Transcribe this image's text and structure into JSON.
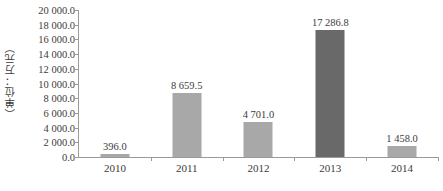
{
  "chart_data": {
    "type": "bar",
    "title": "",
    "subtitle": "",
    "xlabel": "",
    "ylabel": "（单位：万元）",
    "categories": [
      "2010",
      "2011",
      "2012",
      "2013",
      "2014"
    ],
    "values": [
      396.0,
      8659.5,
      4701.0,
      17286.8,
      1458.0
    ],
    "value_labels": [
      "396.0",
      "8 659.5",
      "4 701.0",
      "17 286.8",
      "1 458.0"
    ],
    "series": [
      {
        "name": "",
        "values": [
          396.0,
          8659.5,
          4701.0,
          17286.8,
          1458.0
        ]
      }
    ],
    "ylim": [
      0,
      20000
    ],
    "ytick_step": 2000,
    "ytick_labels": [
      "20 000.0",
      "18 000.0",
      "16 000.0",
      "14 000.0",
      "12 000.0",
      "10 000.0",
      "8 000.0",
      "6 000.0",
      "4 000.0",
      "2 000.0",
      "0.0"
    ],
    "ytick_values": [
      20000,
      18000,
      16000,
      14000,
      12000,
      10000,
      8000,
      6000,
      4000,
      2000,
      0
    ],
    "grid": false,
    "legend": false,
    "legend_position": "none",
    "bar_colors": [
      "#a8a8a8",
      "#a8a8a8",
      "#a8a8a8",
      "#696969",
      "#a8a8a8"
    ],
    "highlight_category": "2013",
    "axis_color": "#9a9a9a",
    "text_color": "#3b3b3b",
    "background_color": "#ffffff"
  }
}
